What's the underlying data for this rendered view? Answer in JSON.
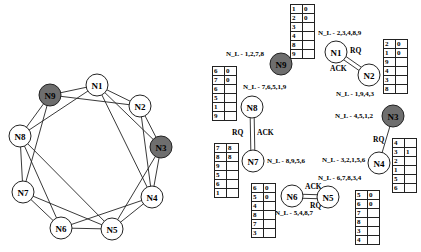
{
  "left_graph": {
    "nodes": [
      {
        "id": "N1",
        "x": 97,
        "y": 85,
        "shaded": false
      },
      {
        "id": "N2",
        "x": 140,
        "y": 106,
        "shaded": false
      },
      {
        "id": "N3",
        "x": 161,
        "y": 147,
        "shaded": true
      },
      {
        "id": "N4",
        "x": 152,
        "y": 197,
        "shaded": false
      },
      {
        "id": "N5",
        "x": 112,
        "y": 229,
        "shaded": false
      },
      {
        "id": "N6",
        "x": 61,
        "y": 228,
        "shaded": false
      },
      {
        "id": "N7",
        "x": 23,
        "y": 192,
        "shaded": false
      },
      {
        "id": "N8",
        "x": 20,
        "y": 136,
        "shaded": false
      },
      {
        "id": "N9",
        "x": 50,
        "y": 95,
        "shaded": true
      }
    ],
    "edges": [
      [
        "N1",
        "N9"
      ],
      [
        "N1",
        "N2"
      ],
      [
        "N1",
        "N8"
      ],
      [
        "N1",
        "N3"
      ],
      [
        "N1",
        "N4"
      ],
      [
        "N9",
        "N2"
      ],
      [
        "N9",
        "N8"
      ],
      [
        "N9",
        "N7"
      ],
      [
        "N2",
        "N3"
      ],
      [
        "N2",
        "N4"
      ],
      [
        "N3",
        "N4"
      ],
      [
        "N3",
        "N5"
      ],
      [
        "N8",
        "N7"
      ],
      [
        "N8",
        "N6"
      ],
      [
        "N8",
        "N5"
      ],
      [
        "N7",
        "N6"
      ],
      [
        "N7",
        "N5"
      ],
      [
        "N6",
        "N5"
      ],
      [
        "N6",
        "N4"
      ],
      [
        "N4",
        "N5"
      ]
    ]
  },
  "right_graph": {
    "nodes": [
      {
        "id": "N1",
        "x": 336,
        "y": 52,
        "shaded": false,
        "nl": "N_L - 2,3,4,8,9",
        "nl_x": 318,
        "nl_y": 35
      },
      {
        "id": "N2",
        "x": 369,
        "y": 75,
        "shaded": false,
        "nl": "N_L - 1,9,4,3",
        "nl_x": 336,
        "nl_y": 96
      },
      {
        "id": "N9",
        "x": 281,
        "y": 64,
        "shaded": true,
        "nl": "N_L - 1,2,7,8",
        "nl_x": 226,
        "nl_y": 56
      },
      {
        "id": "N8",
        "x": 252,
        "y": 107,
        "shaded": false,
        "nl": "N_L - 7,6,5,1,9",
        "nl_x": 243,
        "nl_y": 89
      },
      {
        "id": "N7",
        "x": 253,
        "y": 161,
        "shaded": false,
        "nl": "N_L - 8,9,5,6",
        "nl_x": 267,
        "nl_y": 163
      },
      {
        "id": "N3",
        "x": 393,
        "y": 116,
        "shaded": true,
        "nl": "N_L - 4,5,1,2",
        "nl_x": 335,
        "nl_y": 118
      },
      {
        "id": "N4",
        "x": 379,
        "y": 163,
        "shaded": false,
        "nl": "N_L - 3,2,1,5,6",
        "nl_x": 322,
        "nl_y": 162
      },
      {
        "id": "N5",
        "x": 328,
        "y": 197,
        "shaded": false,
        "nl": "N_L - 6,7,8,3,4",
        "nl_x": 318,
        "nl_y": 180
      },
      {
        "id": "N6",
        "x": 292,
        "y": 196,
        "shaded": false,
        "nl": "N_L - 5,4,8,7",
        "nl_x": 275,
        "nl_y": 215
      }
    ],
    "links": [
      {
        "from": "N1",
        "to": "N2",
        "double": true,
        "labels": [
          {
            "text": "RQ",
            "x": 350,
            "y": 53
          },
          {
            "text": "ACK",
            "x": 330,
            "y": 71
          }
        ]
      },
      {
        "from": "N8",
        "to": "N7",
        "double": true,
        "labels": [
          {
            "text": "RQ",
            "x": 232,
            "y": 135
          },
          {
            "text": "ACK",
            "x": 257,
            "y": 135
          }
        ]
      },
      {
        "from": "N3",
        "to": "N4",
        "double": false,
        "labels": [
          {
            "text": "RQ",
            "x": 373,
            "y": 142
          }
        ]
      },
      {
        "from": "N6",
        "to": "N5",
        "double": true,
        "labels": [
          {
            "text": "ACK",
            "x": 305,
            "y": 189
          },
          {
            "text": "RQ",
            "x": 310,
            "y": 208
          }
        ]
      }
    ],
    "tables": [
      {
        "owner": "N1",
        "x": 290,
        "y": 4,
        "rows": [
          [
            "1",
            "0"
          ],
          [
            "2",
            "0"
          ],
          [
            "3",
            ""
          ],
          [
            "4",
            ""
          ],
          [
            "8",
            ""
          ],
          [
            "9",
            ""
          ]
        ]
      },
      {
        "owner": "N2",
        "x": 383,
        "y": 39,
        "rows": [
          [
            "2",
            "0"
          ],
          [
            "1",
            "0"
          ],
          [
            "9",
            ""
          ],
          [
            "4",
            ""
          ],
          [
            "3",
            ""
          ],
          [
            "8",
            ""
          ]
        ]
      },
      {
        "owner": "N8",
        "x": 212,
        "y": 66,
        "rows": [
          [
            "6",
            "0"
          ],
          [
            "7",
            "0"
          ],
          [
            "6",
            ""
          ],
          [
            "5",
            ""
          ],
          [
            "1",
            ""
          ],
          [
            "9",
            ""
          ]
        ]
      },
      {
        "owner": "N7",
        "x": 214,
        "y": 143,
        "rows": [
          [
            "7",
            "8"
          ],
          [
            "8",
            "8"
          ],
          [
            "9",
            ""
          ],
          [
            "5",
            ""
          ],
          [
            "6",
            ""
          ],
          [
            "1",
            ""
          ]
        ]
      },
      {
        "owner": "N4",
        "x": 392,
        "y": 138,
        "rows": [
          [
            "4",
            ""
          ],
          [
            "3",
            "1"
          ],
          [
            "2",
            ""
          ],
          [
            "1",
            ""
          ],
          [
            "5",
            ""
          ],
          [
            "6",
            ""
          ]
        ]
      },
      {
        "owner": "N6",
        "x": 251,
        "y": 183,
        "rows": [
          [
            "6",
            "0"
          ],
          [
            "5",
            "0"
          ],
          [
            "4",
            ""
          ],
          [
            "8",
            ""
          ],
          [
            "7",
            ""
          ],
          [
            "3",
            ""
          ]
        ]
      },
      {
        "owner": "N5",
        "x": 355,
        "y": 190,
        "rows": [
          [
            "5",
            "0"
          ],
          [
            "6",
            "0"
          ],
          [
            "7",
            ""
          ],
          [
            "8",
            ""
          ],
          [
            "3",
            ""
          ],
          [
            "4",
            ""
          ]
        ]
      }
    ]
  },
  "colors": {
    "shaded_node": "#6e6e6e",
    "stroke": "#222222",
    "background": "#ffffff"
  }
}
